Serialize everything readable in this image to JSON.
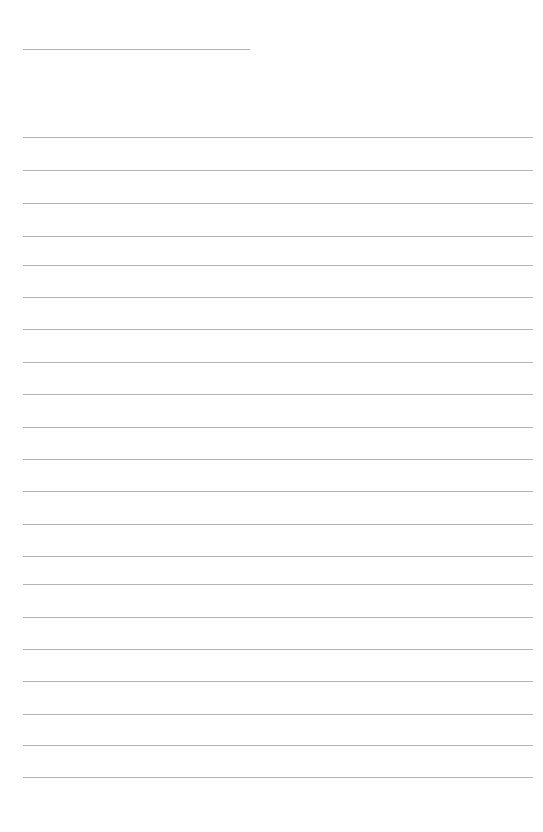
{
  "page": {
    "name": "ruled-note-page",
    "width": 543,
    "height": 832,
    "background_color": "#ffffff",
    "document_type": "blank lined writing page",
    "visible_text": "",
    "text_content_present": false
  },
  "ruling": {
    "line_color": "#b5b5b5",
    "line_thickness_px": 1,
    "left_margin_px": 23,
    "right_margin_px": 533,
    "line_spacing_px": 32.5,
    "total_rules": 22,
    "full_width_rules": 21,
    "short_rules": 1
  },
  "header_rule": {
    "name": "title-rule",
    "label": "",
    "y": 49,
    "x_start": 23,
    "x_end": 250,
    "width": 227,
    "full_width": false
  },
  "body_rules": [
    {
      "index": 1,
      "y": 137,
      "x_start": 23,
      "x_end": 533,
      "width": 510,
      "value": ""
    },
    {
      "index": 2,
      "y": 170,
      "x_start": 23,
      "x_end": 533,
      "width": 510,
      "value": ""
    },
    {
      "index": 3,
      "y": 203,
      "x_start": 23,
      "x_end": 533,
      "width": 510,
      "value": ""
    },
    {
      "index": 4,
      "y": 236,
      "x_start": 23,
      "x_end": 533,
      "width": 510,
      "value": ""
    },
    {
      "index": 5,
      "y": 265,
      "x_start": 23,
      "x_end": 533,
      "width": 510,
      "value": ""
    },
    {
      "index": 6,
      "y": 297,
      "x_start": 23,
      "x_end": 533,
      "width": 510,
      "value": ""
    },
    {
      "index": 7,
      "y": 329,
      "x_start": 23,
      "x_end": 533,
      "width": 510,
      "value": ""
    },
    {
      "index": 8,
      "y": 362,
      "x_start": 23,
      "x_end": 533,
      "width": 510,
      "value": ""
    },
    {
      "index": 9,
      "y": 394,
      "x_start": 23,
      "x_end": 533,
      "width": 510,
      "value": ""
    },
    {
      "index": 10,
      "y": 427,
      "x_start": 23,
      "x_end": 533,
      "width": 510,
      "value": ""
    },
    {
      "index": 11,
      "y": 459,
      "x_start": 23,
      "x_end": 533,
      "width": 510,
      "value": ""
    },
    {
      "index": 12,
      "y": 491,
      "x_start": 23,
      "x_end": 533,
      "width": 510,
      "value": ""
    },
    {
      "index": 13,
      "y": 524,
      "x_start": 23,
      "x_end": 533,
      "width": 510,
      "value": ""
    },
    {
      "index": 14,
      "y": 556,
      "x_start": 23,
      "x_end": 533,
      "width": 510,
      "value": ""
    },
    {
      "index": 15,
      "y": 584,
      "x_start": 23,
      "x_end": 533,
      "width": 510,
      "value": ""
    },
    {
      "index": 16,
      "y": 617,
      "x_start": 23,
      "x_end": 533,
      "width": 510,
      "value": ""
    },
    {
      "index": 17,
      "y": 649,
      "x_start": 23,
      "x_end": 533,
      "width": 510,
      "value": ""
    },
    {
      "index": 18,
      "y": 681,
      "x_start": 23,
      "x_end": 533,
      "width": 510,
      "value": ""
    },
    {
      "index": 19,
      "y": 714,
      "x_start": 23,
      "x_end": 533,
      "width": 510,
      "value": ""
    },
    {
      "index": 20,
      "y": 745,
      "x_start": 23,
      "x_end": 533,
      "width": 510,
      "value": ""
    },
    {
      "index": 21,
      "y": 777,
      "x_start": 23,
      "x_end": 533,
      "width": 510,
      "value": ""
    }
  ],
  "margins": {
    "top_blank_px": 49,
    "bottom_blank_px": 55,
    "left_blank_px": 23,
    "right_blank_px": 10
  }
}
